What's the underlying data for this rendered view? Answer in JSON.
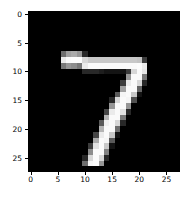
{
  "figure": {
    "kind": "matplotlib-imshow",
    "background_color": "#ffffff",
    "axes_background_color": "#000000",
    "tick_color": "#000000",
    "tick_label_color": "#000000"
  },
  "chart_data": {
    "type": "heatmap",
    "title": "",
    "subtitle": "",
    "xlabel": "",
    "ylabel": "",
    "colormap": "gray",
    "vmin": 0,
    "vmax": 255,
    "grid": false,
    "legend": null,
    "annotations": [],
    "depicted_digit": "7",
    "shape": [
      28,
      28
    ],
    "xlim": [
      -0.5,
      27.5
    ],
    "ylim": [
      27.5,
      -0.5
    ],
    "x_ticks": [
      0,
      5,
      10,
      15,
      20,
      25
    ],
    "y_ticks": [
      0,
      5,
      10,
      15,
      20,
      25
    ],
    "x_tick_labels": [
      "0",
      "5",
      "10",
      "15",
      "20",
      "25"
    ],
    "y_tick_labels": [
      "0",
      "5",
      "10",
      "15",
      "20",
      "25"
    ],
    "pixel_rows": [
      [
        0,
        0,
        0,
        0,
        0,
        0,
        0,
        0,
        0,
        0,
        0,
        0,
        0,
        0,
        0,
        0,
        0,
        0,
        0,
        0,
        0,
        0,
        0,
        0,
        0,
        0,
        0,
        0
      ],
      [
        0,
        0,
        0,
        0,
        0,
        0,
        0,
        0,
        0,
        0,
        0,
        0,
        0,
        0,
        0,
        0,
        0,
        0,
        0,
        0,
        0,
        0,
        0,
        0,
        0,
        0,
        0,
        0
      ],
      [
        0,
        0,
        0,
        0,
        0,
        0,
        0,
        0,
        0,
        0,
        0,
        0,
        0,
        0,
        0,
        0,
        0,
        0,
        0,
        0,
        0,
        0,
        0,
        0,
        0,
        0,
        0,
        0
      ],
      [
        0,
        0,
        0,
        0,
        0,
        0,
        0,
        0,
        0,
        0,
        0,
        0,
        0,
        0,
        0,
        0,
        0,
        0,
        0,
        0,
        0,
        0,
        0,
        0,
        0,
        0,
        0,
        0
      ],
      [
        0,
        0,
        0,
        0,
        0,
        0,
        0,
        0,
        0,
        0,
        0,
        0,
        0,
        0,
        0,
        0,
        0,
        0,
        0,
        0,
        0,
        0,
        0,
        0,
        0,
        0,
        0,
        0
      ],
      [
        0,
        0,
        0,
        0,
        0,
        0,
        0,
        0,
        0,
        0,
        0,
        0,
        0,
        0,
        0,
        0,
        0,
        0,
        0,
        0,
        0,
        0,
        0,
        0,
        0,
        0,
        0,
        0
      ],
      [
        0,
        0,
        0,
        0,
        0,
        0,
        0,
        0,
        0,
        0,
        0,
        0,
        0,
        0,
        0,
        0,
        0,
        0,
        0,
        0,
        0,
        0,
        0,
        0,
        0,
        0,
        0,
        0
      ],
      [
        0,
        0,
        0,
        0,
        0,
        0,
        110,
        160,
        170,
        150,
        40,
        0,
        0,
        0,
        0,
        0,
        0,
        0,
        0,
        0,
        0,
        0,
        0,
        0,
        0,
        0,
        0,
        0
      ],
      [
        0,
        0,
        0,
        0,
        0,
        0,
        235,
        250,
        252,
        252,
        215,
        200,
        200,
        200,
        200,
        200,
        200,
        200,
        200,
        200,
        195,
        60,
        0,
        0,
        0,
        0,
        0,
        0
      ],
      [
        0,
        0,
        0,
        0,
        0,
        0,
        120,
        150,
        140,
        120,
        235,
        250,
        250,
        250,
        250,
        250,
        250,
        250,
        250,
        250,
        252,
        235,
        0,
        0,
        0,
        0,
        0,
        0
      ],
      [
        0,
        0,
        0,
        0,
        0,
        0,
        0,
        0,
        0,
        0,
        40,
        40,
        40,
        30,
        20,
        20,
        20,
        20,
        60,
        215,
        250,
        230,
        0,
        0,
        0,
        0,
        0,
        0
      ],
      [
        0,
        0,
        0,
        0,
        0,
        0,
        0,
        0,
        0,
        0,
        0,
        0,
        0,
        0,
        0,
        0,
        0,
        0,
        150,
        250,
        250,
        120,
        0,
        0,
        0,
        0,
        0,
        0
      ],
      [
        0,
        0,
        0,
        0,
        0,
        0,
        0,
        0,
        0,
        0,
        0,
        0,
        0,
        0,
        0,
        0,
        0,
        60,
        235,
        250,
        215,
        40,
        0,
        0,
        0,
        0,
        0,
        0
      ],
      [
        0,
        0,
        0,
        0,
        0,
        0,
        0,
        0,
        0,
        0,
        0,
        0,
        0,
        0,
        0,
        0,
        0,
        160,
        250,
        250,
        100,
        0,
        0,
        0,
        0,
        0,
        0,
        0
      ],
      [
        0,
        0,
        0,
        0,
        0,
        0,
        0,
        0,
        0,
        0,
        0,
        0,
        0,
        0,
        0,
        0,
        90,
        245,
        250,
        200,
        20,
        0,
        0,
        0,
        0,
        0,
        0,
        0
      ],
      [
        0,
        0,
        0,
        0,
        0,
        0,
        0,
        0,
        0,
        0,
        0,
        0,
        0,
        0,
        0,
        40,
        215,
        250,
        245,
        80,
        0,
        0,
        0,
        0,
        0,
        0,
        0,
        0
      ],
      [
        0,
        0,
        0,
        0,
        0,
        0,
        0,
        0,
        0,
        0,
        0,
        0,
        0,
        0,
        0,
        150,
        250,
        250,
        150,
        0,
        0,
        0,
        0,
        0,
        0,
        0,
        0,
        0
      ],
      [
        0,
        0,
        0,
        0,
        0,
        0,
        0,
        0,
        0,
        0,
        0,
        0,
        0,
        0,
        70,
        235,
        250,
        225,
        40,
        0,
        0,
        0,
        0,
        0,
        0,
        0,
        0,
        0
      ],
      [
        0,
        0,
        0,
        0,
        0,
        0,
        0,
        0,
        0,
        0,
        0,
        0,
        0,
        0,
        180,
        250,
        250,
        120,
        0,
        0,
        0,
        0,
        0,
        0,
        0,
        0,
        0,
        0
      ],
      [
        0,
        0,
        0,
        0,
        0,
        0,
        0,
        0,
        0,
        0,
        0,
        0,
        0,
        90,
        240,
        250,
        215,
        40,
        0,
        0,
        0,
        0,
        0,
        0,
        0,
        0,
        0,
        0
      ],
      [
        0,
        0,
        0,
        0,
        0,
        0,
        0,
        0,
        0,
        0,
        0,
        0,
        0,
        180,
        250,
        250,
        110,
        0,
        0,
        0,
        0,
        0,
        0,
        0,
        0,
        0,
        0,
        0
      ],
      [
        0,
        0,
        0,
        0,
        0,
        0,
        0,
        0,
        0,
        0,
        0,
        0,
        70,
        235,
        250,
        200,
        20,
        0,
        0,
        0,
        0,
        0,
        0,
        0,
        0,
        0,
        0,
        0
      ],
      [
        0,
        0,
        0,
        0,
        0,
        0,
        0,
        0,
        0,
        0,
        0,
        0,
        170,
        250,
        245,
        90,
        0,
        0,
        0,
        0,
        0,
        0,
        0,
        0,
        0,
        0,
        0,
        0
      ],
      [
        0,
        0,
        0,
        0,
        0,
        0,
        0,
        0,
        0,
        0,
        0,
        60,
        225,
        250,
        200,
        20,
        0,
        0,
        0,
        0,
        0,
        0,
        0,
        0,
        0,
        0,
        0,
        0
      ],
      [
        0,
        0,
        0,
        0,
        0,
        0,
        0,
        0,
        0,
        0,
        0,
        140,
        250,
        250,
        130,
        0,
        0,
        0,
        0,
        0,
        0,
        0,
        0,
        0,
        0,
        0,
        0,
        0
      ],
      [
        0,
        0,
        0,
        0,
        0,
        0,
        0,
        0,
        0,
        0,
        40,
        215,
        250,
        215,
        40,
        0,
        0,
        0,
        0,
        0,
        0,
        0,
        0,
        0,
        0,
        0,
        0,
        0
      ],
      [
        0,
        0,
        0,
        0,
        0,
        0,
        0,
        0,
        0,
        0,
        110,
        245,
        250,
        150,
        0,
        0,
        0,
        0,
        0,
        0,
        0,
        0,
        0,
        0,
        0,
        0,
        0,
        0
      ],
      [
        0,
        0,
        0,
        0,
        0,
        0,
        0,
        0,
        0,
        0,
        0,
        0,
        0,
        0,
        0,
        0,
        0,
        0,
        0,
        0,
        0,
        0,
        0,
        0,
        0,
        0,
        0,
        0
      ]
    ]
  }
}
